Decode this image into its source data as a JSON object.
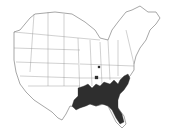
{
  "map": {
    "type": "species-range-map",
    "region": "Eastern North America (United States and southern Canada)",
    "range_color": "#2e2e2e",
    "outline_color": "#6b6b6b",
    "background": "#ffffff",
    "range_description": "Shaded distribution across southeastern United States: Louisiana, Mississippi, Alabama, Georgia, Florida (north/central), South Carolina, North Carolina coastal plain, southeastern Virginia, western Tennessee/Kentucky areas, with scattered isolated points in the Midwest"
  }
}
